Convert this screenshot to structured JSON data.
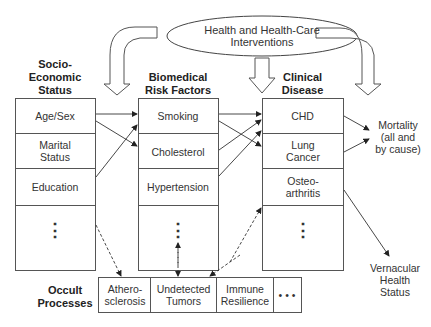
{
  "title_node": {
    "line1": "Health and Health-Care",
    "line2": "Interventions"
  },
  "columns": [
    {
      "heading": [
        "Socio-",
        "Economic",
        "Status"
      ],
      "items": [
        "Age/Sex",
        "Marital Status",
        "Education",
        "⋮"
      ]
    },
    {
      "heading": [
        "Biomedical",
        "Risk Factors"
      ],
      "items": [
        "Smoking",
        "Cholesterol",
        "Hypertension",
        "⋮"
      ]
    },
    {
      "heading": [
        "Clinical",
        "Disease"
      ],
      "items": [
        "CHD",
        "Lung Cancer",
        "Osteo-arthritis",
        "⋮"
      ]
    }
  ],
  "outcomes": {
    "mortality": [
      "Mortality",
      "(all and",
      "by cause)"
    ],
    "vernacular": [
      "Vernacular",
      "Health",
      "Status"
    ]
  },
  "occult": {
    "heading": [
      "Occult",
      "Processes"
    ],
    "items": [
      "Athero-sclerosis",
      "Undetected Tumors",
      "Immune Resilience",
      "• • •"
    ]
  },
  "colors": {
    "line": "#333333",
    "background": "#ffffff"
  }
}
